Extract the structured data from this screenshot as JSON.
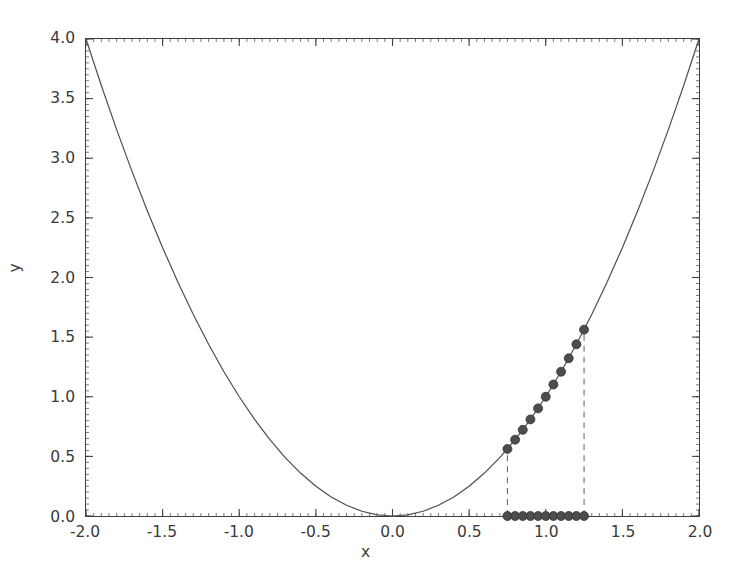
{
  "chart_data": {
    "type": "line",
    "title": "",
    "xlabel": "x",
    "ylabel": "y",
    "xlim": [
      -2.0,
      2.0
    ],
    "ylim": [
      0.0,
      4.0
    ],
    "grid": false,
    "legend": null,
    "xticks": [
      -2.0,
      -1.5,
      -1.0,
      -0.5,
      0.0,
      0.5,
      1.0,
      1.5,
      2.0
    ],
    "xtick_labels": [
      "-2.0",
      "-1.5",
      "-1.0",
      "-0.5",
      "0.0",
      "0.5",
      "1.0",
      "1.5",
      "2.0"
    ],
    "yticks": [
      0.0,
      0.5,
      1.0,
      1.5,
      2.0,
      2.5,
      3.0,
      3.5,
      4.0
    ],
    "ytick_labels": [
      "0.0",
      "0.5",
      "1.0",
      "1.5",
      "2.0",
      "2.5",
      "3.0",
      "3.5",
      "4.0"
    ],
    "series": [
      {
        "name": "y = x^2",
        "type": "line",
        "style": "solid",
        "color": "#4d4d4d",
        "linewidth": 1.2,
        "x": [
          -2.0,
          -1.9,
          -1.8,
          -1.7,
          -1.6,
          -1.5,
          -1.4,
          -1.3,
          -1.2,
          -1.1,
          -1.0,
          -0.9,
          -0.8,
          -0.7,
          -0.6,
          -0.5,
          -0.4,
          -0.3,
          -0.2,
          -0.1,
          0.0,
          0.1,
          0.2,
          0.3,
          0.4,
          0.5,
          0.6,
          0.7,
          0.8,
          0.9,
          1.0,
          1.1,
          1.2,
          1.3,
          1.4,
          1.5,
          1.6,
          1.7,
          1.8,
          1.9,
          2.0
        ],
        "y": [
          4.0,
          3.61,
          3.24,
          2.89,
          2.56,
          2.25,
          1.96,
          1.69,
          1.44,
          1.21,
          1.0,
          0.81,
          0.64,
          0.49,
          0.36,
          0.25,
          0.16,
          0.09,
          0.04,
          0.01,
          0.0,
          0.01,
          0.04,
          0.09,
          0.16,
          0.25,
          0.36,
          0.49,
          0.64,
          0.81,
          1.0,
          1.21,
          1.44,
          1.69,
          1.96,
          2.25,
          2.56,
          2.89,
          3.24,
          3.61,
          4.0
        ]
      },
      {
        "name": "samples on curve",
        "type": "scatter",
        "marker": "circle",
        "color": "#4d4d4d",
        "markersize": 9,
        "x": [
          0.75,
          0.8,
          0.85,
          0.9,
          0.95,
          1.0,
          1.05,
          1.1,
          1.15,
          1.2,
          1.25
        ],
        "y": [
          0.5625,
          0.64,
          0.7225,
          0.81,
          0.9025,
          1.0,
          1.1025,
          1.21,
          1.3225,
          1.44,
          1.5625
        ]
      },
      {
        "name": "samples on baseline",
        "type": "scatter",
        "marker": "circle",
        "color": "#4d4d4d",
        "markersize": 9,
        "x": [
          0.75,
          0.8,
          0.85,
          0.9,
          0.95,
          1.0,
          1.05,
          1.1,
          1.15,
          1.2,
          1.25
        ],
        "y": [
          0.0,
          0.0,
          0.0,
          0.0,
          0.0,
          0.0,
          0.0,
          0.0,
          0.0,
          0.0,
          0.0
        ]
      }
    ],
    "annotations": [
      {
        "name": "left-bound",
        "type": "vline",
        "style": "dashed",
        "color": "#6e6e6e",
        "x": 0.75,
        "y_from": 0.0,
        "y_to": 0.5625
      },
      {
        "name": "right-bound",
        "type": "vline",
        "style": "dashed",
        "color": "#6e6e6e",
        "x": 1.25,
        "y_from": 0.0,
        "y_to": 1.5625
      }
    ],
    "interval": [
      0.75,
      1.25
    ]
  },
  "axes": {
    "x_title": "x",
    "y_title": "y"
  },
  "colors": {
    "curve": "#4d4d4d",
    "marker": "#4d4d4d",
    "dashed": "#6e6e6e",
    "frame": "#3f3f3f",
    "text": "#3a3a3a",
    "background": "#ffffff"
  }
}
